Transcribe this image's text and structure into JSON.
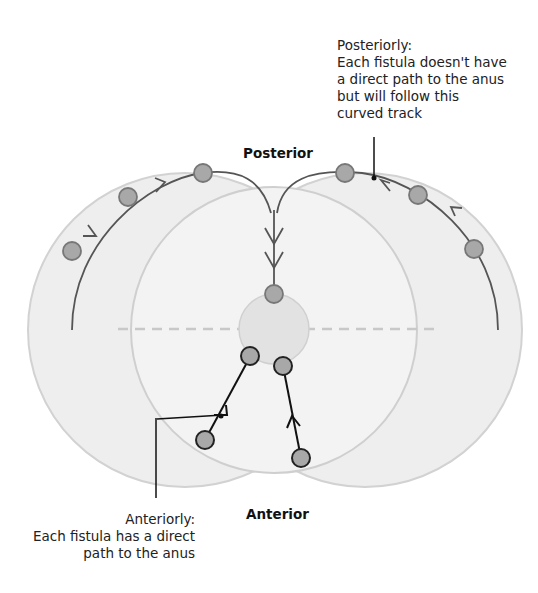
{
  "labels": {
    "posterior": "Posterior",
    "anterior": "Anterior",
    "posterior_note": {
      "line1": "Posteriorly:",
      "line2": "Each fistula doesn't have",
      "line3": "a direct path to the anus",
      "line4": "but will follow this",
      "line5": "curved track"
    },
    "anterior_note": {
      "line1": "Anteriorly:",
      "line2": "Each fistula has a direct",
      "line3": "path to the anus"
    }
  },
  "colors": {
    "outer_fill": "#eeeeee",
    "outer_stroke": "#cfcfcf",
    "inner_fill": "#f3f3f3",
    "anus_fill": "#e2e2e2",
    "node_fill": "#a8a8a8",
    "track_posterior": "#555555",
    "track_anterior": "#111111",
    "dashed_line": "#c8c8c8"
  }
}
